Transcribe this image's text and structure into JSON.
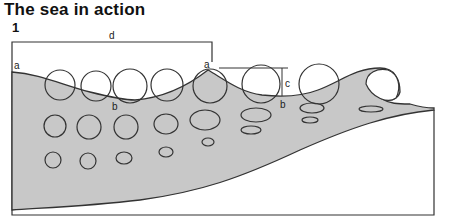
{
  "title": "The sea in action",
  "figure_number": "1",
  "labels": {
    "wavelength": "d",
    "crest_left": "a",
    "crest_right": "a",
    "trough_left": "b",
    "trough_right": "b",
    "wave_height": "c"
  },
  "colors": {
    "water_fill": "#c8c8c8",
    "outline": "#333333",
    "background": "#ffffff"
  }
}
